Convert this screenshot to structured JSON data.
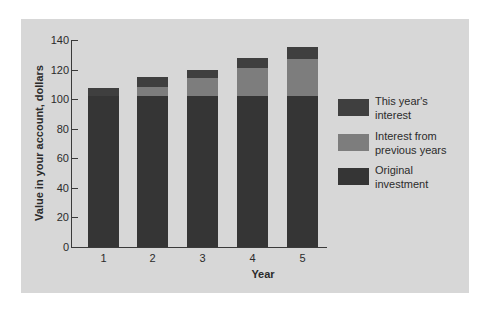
{
  "chart_data": {
    "type": "bar",
    "stacked": true,
    "title": "",
    "xlabel": "Year",
    "ylabel": "Value in your account, dollars",
    "ylim": [
      0,
      140
    ],
    "yticks": [
      0,
      20,
      40,
      60,
      80,
      100,
      120,
      140
    ],
    "categories": [
      "1",
      "2",
      "3",
      "4",
      "5"
    ],
    "series": [
      {
        "name": "Original investment",
        "color": "#353535",
        "values": [
          102,
          102,
          102,
          102,
          102
        ]
      },
      {
        "name": "Interest from previous years",
        "color": "#7d7d7d",
        "values": [
          0,
          6,
          12,
          19,
          25
        ]
      },
      {
        "name": "This year's interest",
        "color": "#3f3f3f",
        "values": [
          5.5,
          7,
          6,
          7,
          8
        ]
      }
    ],
    "totals": [
      107.5,
      115,
      120,
      128,
      135
    ],
    "grid": false,
    "legend_position": "right"
  },
  "legend": {
    "items": [
      {
        "line1": "This year's",
        "line2": "interest",
        "color": "#3f3f3f"
      },
      {
        "line1": "Interest from",
        "line2": "previous years",
        "color": "#7d7d7d"
      },
      {
        "line1": "Original",
        "line2": "investment",
        "color": "#353535"
      }
    ]
  },
  "colors": {
    "background": "#d7d7d7",
    "axis": "#3a3a3a",
    "text": "#2b2b2b"
  }
}
